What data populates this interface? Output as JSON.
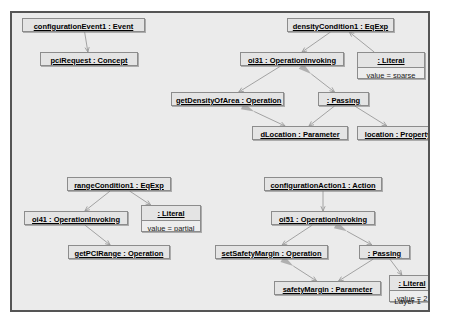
{
  "diagram": {
    "layer_label": "Layer 1",
    "colors": {
      "canvas_background": "#ebebeb",
      "canvas_border": "#555555",
      "node_fill": "#e4e4e4",
      "node_slot_fill": "#ededed",
      "node_border": "#8c8c8c",
      "thin_edge": "#9a9a9a",
      "thick_edge": "#b0b0b0",
      "text": "#000000"
    },
    "nodes": [
      {
        "id": "configurationEvent1",
        "title": "configurationEvent1 : Event",
        "slot": null,
        "x": 20,
        "y": 14,
        "w": 123,
        "h": 14
      },
      {
        "id": "pciRequest",
        "title": "pciRequest : Concept",
        "slot": null,
        "x": 38,
        "y": 48,
        "w": 98,
        "h": 14
      },
      {
        "id": "densityCondition1",
        "title": "densityCondition1 : EqExp",
        "slot": null,
        "x": 285,
        "y": 14,
        "w": 107,
        "h": 14
      },
      {
        "id": "oi31",
        "title": "oi31 : OperationInvoking",
        "slot": null,
        "x": 238,
        "y": 48,
        "w": 104,
        "h": 14
      },
      {
        "id": "densityLiteral",
        "title": ": Literal",
        "slot": "value = sparse",
        "x": 355,
        "y": 48,
        "w": 68,
        "h": 27
      },
      {
        "id": "getDensityOfArea",
        "title": "getDensityOfArea : Operation",
        "slot": null,
        "x": 169,
        "y": 88,
        "w": 113,
        "h": 14
      },
      {
        "id": "densityPassing",
        "title": ": Passing",
        "slot": null,
        "x": 316,
        "y": 88,
        "w": 51,
        "h": 14
      },
      {
        "id": "dLocation",
        "title": "dLocation : Parameter",
        "slot": null,
        "x": 250,
        "y": 122,
        "w": 96,
        "h": 14
      },
      {
        "id": "location",
        "title": "location : Property",
        "slot": null,
        "x": 355,
        "y": 122,
        "w": 82,
        "h": 14
      },
      {
        "id": "rangeCondition1",
        "title": "rangeCondition1 : EqExp",
        "slot": null,
        "x": 65,
        "y": 173,
        "w": 104,
        "h": 14
      },
      {
        "id": "oi41",
        "title": "oi41 : OperationInvoking",
        "slot": null,
        "x": 22,
        "y": 207,
        "w": 104,
        "h": 14
      },
      {
        "id": "rangeLiteral",
        "title": ": Literal",
        "slot": "value = partial",
        "x": 139,
        "y": 201,
        "w": 60,
        "h": 27
      },
      {
        "id": "getPCIRange",
        "title": "getPCIRange : Operation",
        "slot": null,
        "x": 66,
        "y": 241,
        "w": 102,
        "h": 14
      },
      {
        "id": "configurationAction1",
        "title": "configurationAction1 : Action",
        "slot": null,
        "x": 262,
        "y": 173,
        "w": 118,
        "h": 14
      },
      {
        "id": "oi51",
        "title": "oi51 : OperationInvoking",
        "slot": null,
        "x": 269,
        "y": 207,
        "w": 104,
        "h": 14
      },
      {
        "id": "setSafetyMargin",
        "title": "setSafetyMargin : Operation",
        "slot": null,
        "x": 213,
        "y": 241,
        "w": 113,
        "h": 14
      },
      {
        "id": "safetyPassing",
        "title": ": Passing",
        "slot": null,
        "x": 357,
        "y": 241,
        "w": 51,
        "h": 14
      },
      {
        "id": "safetyMargin",
        "title": "safetyMargin : Parameter",
        "slot": null,
        "x": 272,
        "y": 277,
        "w": 107,
        "h": 14
      },
      {
        "id": "safetyLiteral",
        "title": ": Literal",
        "slot": "value = 2",
        "x": 387,
        "y": 271,
        "w": 46,
        "h": 27
      }
    ],
    "edges": [
      {
        "id": "e1",
        "from": "configurationEvent1",
        "to": "pciRequest",
        "style": "thin"
      },
      {
        "id": "e2",
        "from": "densityCondition1",
        "to": "oi31",
        "style": "thin"
      },
      {
        "id": "e3",
        "from": "densityLiteral",
        "to": "densityCondition1",
        "style": "thin"
      },
      {
        "id": "e4",
        "from": "oi31",
        "to": "getDensityOfArea",
        "style": "thin"
      },
      {
        "id": "e5",
        "from": "oi31",
        "to": "densityPassing",
        "style": "thick"
      },
      {
        "id": "e6",
        "from": "getDensityOfArea",
        "to": "dLocation",
        "style": "thick"
      },
      {
        "id": "e7",
        "from": "densityPassing",
        "to": "dLocation",
        "style": "thin"
      },
      {
        "id": "e8",
        "from": "densityPassing",
        "to": "location",
        "style": "thin"
      },
      {
        "id": "e9",
        "from": "rangeCondition1",
        "to": "oi41",
        "style": "thin"
      },
      {
        "id": "e10",
        "from": "rangeCondition1",
        "to": "rangeLiteral",
        "style": "thin"
      },
      {
        "id": "e11",
        "from": "oi41",
        "to": "getPCIRange",
        "style": "thin"
      },
      {
        "id": "e12",
        "from": "configurationAction1",
        "to": "oi51",
        "style": "thin"
      },
      {
        "id": "e13",
        "from": "oi51",
        "to": "setSafetyMargin",
        "style": "thin"
      },
      {
        "id": "e14",
        "from": "oi51",
        "to": "safetyPassing",
        "style": "thick"
      },
      {
        "id": "e15",
        "from": "setSafetyMargin",
        "to": "safetyMargin",
        "style": "thick"
      },
      {
        "id": "e16",
        "from": "safetyPassing",
        "to": "safetyMargin",
        "style": "thin"
      },
      {
        "id": "e17",
        "from": "safetyPassing",
        "to": "safetyLiteral",
        "style": "thin"
      }
    ]
  }
}
